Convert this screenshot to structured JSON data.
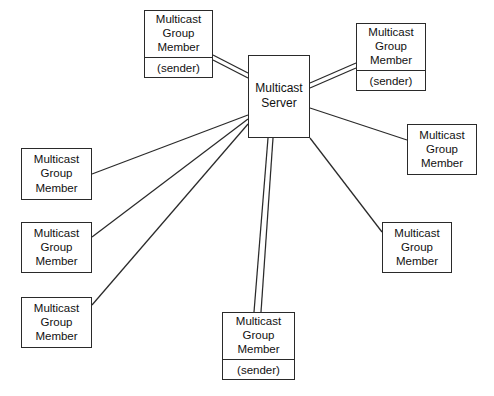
{
  "diagram": {
    "background_color": "#ffffff",
    "stroke_color": "#2a2a2a",
    "text_color": "#111111",
    "server": {
      "id": "multicast-server",
      "line1": "Multicast",
      "line2": "Server",
      "x": 248,
      "y": 55,
      "w": 62,
      "h": 83
    },
    "members": [
      {
        "id": "member-top-left-sender",
        "line1": "Multicast",
        "line2": "Group",
        "line3": "Member",
        "sublabel": "(sender)",
        "has_sender": true,
        "x": 144,
        "y": 10,
        "w": 69,
        "h": 68
      },
      {
        "id": "member-top-right-sender",
        "line1": "Multicast",
        "line2": "Group",
        "line3": "Member",
        "sublabel": "(sender)",
        "has_sender": true,
        "x": 356,
        "y": 23,
        "w": 70,
        "h": 68
      },
      {
        "id": "member-right-upper",
        "line1": "Multicast",
        "line2": "Group",
        "line3": "Member",
        "sublabel": "",
        "has_sender": false,
        "x": 407,
        "y": 124,
        "w": 70,
        "h": 51
      },
      {
        "id": "member-right-lower",
        "line1": "Multicast",
        "line2": "Group",
        "line3": "Member",
        "sublabel": "",
        "has_sender": false,
        "x": 382,
        "y": 222,
        "w": 70,
        "h": 51
      },
      {
        "id": "member-left-upper",
        "line1": "Multicast",
        "line2": "Group",
        "line3": "Member",
        "sublabel": "",
        "has_sender": false,
        "x": 21,
        "y": 148,
        "w": 71,
        "h": 52
      },
      {
        "id": "member-left-middle",
        "line1": "Multicast",
        "line2": "Group",
        "line3": "Member",
        "sublabel": "",
        "has_sender": false,
        "x": 21,
        "y": 222,
        "w": 71,
        "h": 51
      },
      {
        "id": "member-left-lower",
        "line1": "Multicast",
        "line2": "Group",
        "line3": "Member",
        "sublabel": "",
        "has_sender": false,
        "x": 21,
        "y": 297,
        "w": 71,
        "h": 51
      },
      {
        "id": "member-bottom-sender",
        "line1": "Multicast",
        "line2": "Group",
        "line3": "Member",
        "sublabel": "(sender)",
        "has_sender": true,
        "x": 222,
        "y": 312,
        "w": 73,
        "h": 68
      }
    ],
    "connections": [
      {
        "id": "link-top-left-sender",
        "type": "double",
        "from": "member-top-left-sender",
        "to": "multicast-server"
      },
      {
        "id": "link-top-right-sender",
        "type": "double",
        "from": "multicast-server",
        "to": "member-top-right-sender"
      },
      {
        "id": "link-bottom-sender",
        "type": "double",
        "from": "multicast-server",
        "to": "member-bottom-sender"
      },
      {
        "id": "link-right-upper",
        "type": "single",
        "from": "multicast-server",
        "to": "member-right-upper"
      },
      {
        "id": "link-right-lower",
        "type": "single",
        "from": "multicast-server",
        "to": "member-right-lower"
      },
      {
        "id": "link-left-upper",
        "type": "single",
        "from": "multicast-server",
        "to": "member-left-upper"
      },
      {
        "id": "link-left-middle",
        "type": "single",
        "from": "multicast-server",
        "to": "member-left-middle"
      },
      {
        "id": "link-left-lower",
        "type": "single",
        "from": "multicast-server",
        "to": "member-left-lower"
      }
    ]
  }
}
